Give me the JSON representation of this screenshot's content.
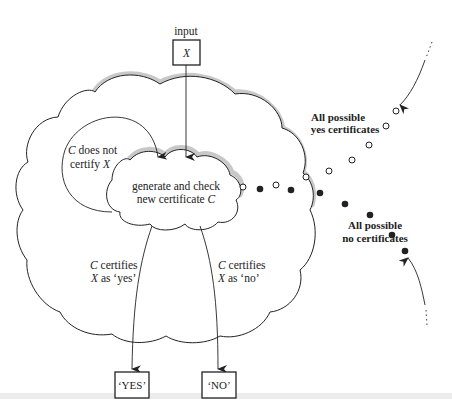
{
  "diagram": {
    "input_label": "input",
    "input_box": "X",
    "inner_cloud": {
      "line1": "generate and check",
      "line2_prefix": "new certificate ",
      "line2_var": "C"
    },
    "loop_label": {
      "line1_var": "C",
      "line1_rest": " does not",
      "line2_prefix": "certify ",
      "line2_var": "X"
    },
    "yes_branch": {
      "line1_var": "C",
      "line1_rest": " certifies",
      "line2_var": "X",
      "line2_rest": " as ‘yes’"
    },
    "no_branch": {
      "line1_var": "C",
      "line1_rest": " certifies",
      "line2_var": "X",
      "line2_rest": " as ‘no’"
    },
    "outputs": {
      "yes": "‘YES’",
      "no": "‘NO’"
    },
    "yes_certificates": {
      "line1": "All possible",
      "line2": "yes certificates",
      "marker": "open-circle"
    },
    "no_certificates": {
      "line1": "All possible",
      "line2": "no certificates",
      "marker": "filled-circle"
    },
    "colors": {
      "ink": "#222222",
      "shadow": "#c8c8c8",
      "background": "#ffffff"
    }
  }
}
